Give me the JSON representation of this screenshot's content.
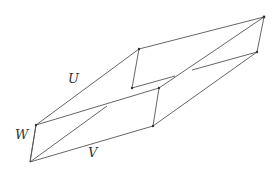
{
  "diagram": {
    "type": "parallelepiped",
    "labels": {
      "u": "U",
      "v": "V",
      "w": "W"
    },
    "stroke_color": "#555555",
    "vertices": {
      "A": [
        30,
        162
      ],
      "B": [
        36,
        125
      ],
      "C": [
        139,
        49
      ],
      "D": [
        264,
        17
      ],
      "E": [
        159,
        88
      ],
      "F": [
        257,
        52
      ],
      "G": [
        153,
        126
      ],
      "H": [
        132,
        88
      ]
    }
  }
}
